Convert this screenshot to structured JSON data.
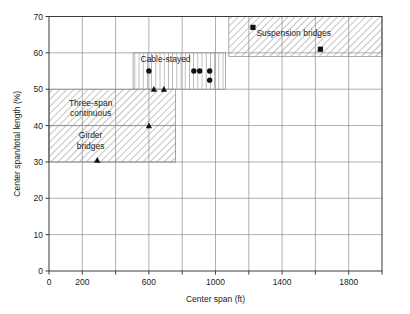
{
  "chart_data": {
    "type": "scatter",
    "title": "",
    "xlabel": "Center span (ft)",
    "ylabel": "Center span/total length (%)",
    "xlim": [
      0,
      2000
    ],
    "ylim": [
      0,
      70
    ],
    "xticks": [
      0,
      200,
      400,
      600,
      800,
      1000,
      1200,
      1400,
      1600,
      1800,
      2000
    ],
    "xtick_labels": [
      "0",
      "200",
      "",
      "600",
      "",
      "1000",
      "",
      "1400",
      "",
      "1800",
      ""
    ],
    "yticks": [
      0,
      10,
      20,
      30,
      40,
      50,
      60,
      70
    ],
    "ytick_labels": [
      "0",
      "10",
      "20",
      "30",
      "40",
      "50",
      "60",
      "70"
    ],
    "grid": true,
    "legend": "none",
    "regions": [
      {
        "name": "suspension-bridges",
        "label": "Suspension bridges",
        "hatch": "diagonal",
        "x_range": [
          1080,
          2000
        ],
        "y_range": [
          59,
          70
        ],
        "label_x": 1470,
        "label_y": 64.5
      },
      {
        "name": "cable-stayed",
        "label": "Cable-stayed",
        "hatch": "vertical",
        "x_range": [
          505,
          1060
        ],
        "y_range": [
          50,
          60
        ],
        "label_x": 700,
        "label_y": 57.5
      },
      {
        "name": "three-span-continuous",
        "label": "Three-span\ncontinuous",
        "hatch": "diagonal",
        "x_range": [
          0,
          760
        ],
        "y_range": [
          30,
          50
        ],
        "label_x": 250,
        "label_y": 45.5
      },
      {
        "name": "girder-bridges",
        "label": "Girder\nbridges",
        "hatch": "diagonal",
        "x_range": [
          0,
          760
        ],
        "y_range": [
          30,
          40
        ],
        "label_x": 250,
        "label_y": 36.5
      }
    ],
    "series": [
      {
        "name": "Suspension bridges",
        "marker": "square",
        "points": [
          {
            "x": 1225,
            "y": 67
          },
          {
            "x": 1630,
            "y": 61
          }
        ]
      },
      {
        "name": "Cable-stayed",
        "marker": "circle",
        "points": [
          {
            "x": 600,
            "y": 55
          },
          {
            "x": 870,
            "y": 55
          },
          {
            "x": 905,
            "y": 55
          },
          {
            "x": 965,
            "y": 55
          },
          {
            "x": 965,
            "y": 52.5
          }
        ]
      },
      {
        "name": "Girder / three-span continuous",
        "marker": "triangle",
        "points": [
          {
            "x": 630,
            "y": 50
          },
          {
            "x": 690,
            "y": 50
          },
          {
            "x": 600,
            "y": 40
          },
          {
            "x": 290,
            "y": 30.5
          }
        ]
      }
    ]
  }
}
